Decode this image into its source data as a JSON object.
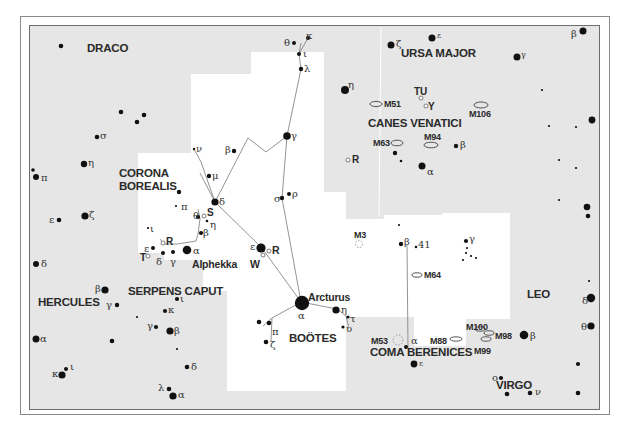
{
  "map": {
    "type": "star-chart",
    "region": "Boötes, Corona Borealis, Canes Venatici, Coma Berenices",
    "colors": {
      "background_outside": "#e6e6e6",
      "highlight_region": "#ffffff",
      "star": "#111111",
      "lines": "#777777",
      "variable_star": "#9a9a9a",
      "border": "#6e6e6e"
    }
  },
  "constellations": [
    {
      "id": "draco",
      "name": "DRACO"
    },
    {
      "id": "ursa-major",
      "name": "URSA MAJOR"
    },
    {
      "id": "canes-venatici",
      "name": "CANES VENATICI"
    },
    {
      "id": "corona-borealis",
      "name": "CORONA\nBOREALIS",
      "line1": "CORONA",
      "line2": "BOREALIS"
    },
    {
      "id": "hercules",
      "name": "HERCULES"
    },
    {
      "id": "serpens-caput",
      "name": "SERPENS CAPUT"
    },
    {
      "id": "bootes",
      "name": "BOÖTES"
    },
    {
      "id": "coma-berenices",
      "name": "COMA BERENICES"
    },
    {
      "id": "leo",
      "name": "LEO"
    },
    {
      "id": "virgo",
      "name": "VIRGO"
    }
  ],
  "named_stars": [
    {
      "name": "Arcturus",
      "designation": "α Boötis"
    },
    {
      "name": "Alphekka",
      "designation": "α Coronae Borealis"
    }
  ],
  "deep_sky_objects": [
    "M51",
    "M106",
    "M63",
    "M94",
    "M3",
    "M64",
    "M53",
    "M100",
    "M98",
    "M88",
    "M99"
  ],
  "variable_stars": [
    "TU",
    "Y",
    "R",
    "S",
    "R",
    "W",
    "R",
    "T"
  ],
  "greek_labels": {
    "ursa_major": [
      "ζ",
      "ε",
      "γ",
      "β",
      "η"
    ],
    "draco": [
      "σ",
      "η",
      "π",
      "ε",
      "ζ",
      "δ"
    ],
    "bootes": [
      "θ",
      "κ",
      "ι",
      "λ",
      "β",
      "γ",
      "δ",
      "μ",
      "ν",
      "σ",
      "ρ",
      "ε",
      "α",
      "η",
      "τ",
      "υ",
      "π",
      "ζ"
    ],
    "corona_borealis": [
      "π",
      "θ",
      "η",
      "β",
      "ι",
      "ε",
      "δ",
      "γ",
      "α"
    ],
    "canes_venatici": [
      "β",
      "α"
    ],
    "hercules_serpens": [
      "β",
      "γ",
      "α",
      "κ",
      "ι",
      "γ",
      "β",
      "ι",
      "κ",
      "δ",
      "λ",
      "α"
    ],
    "coma": [
      "β",
      "γ",
      "α"
    ],
    "leo": [
      "δ",
      "θ",
      "β"
    ],
    "virgo": [
      "ε",
      "ο",
      "ν"
    ]
  },
  "labels": {
    "draco": "DRACO",
    "ursa_major": "URSA MAJOR",
    "canes_venatici": "CANES VENATICI",
    "corona_1": "CORONA",
    "corona_2": "BOREALIS",
    "hercules": "HERCULES",
    "serpens": "SERPENS CAPUT",
    "bootes": "BOÖTES",
    "coma": "COMA BERENICES",
    "leo": "LEO",
    "virgo": "VIRGO",
    "arcturus": "Arcturus",
    "alphekka": "Alphekka",
    "m51": "M51",
    "m106": "M106",
    "m63": "M63",
    "m94": "M94",
    "m3": "M3",
    "m64": "M64",
    "m53": "M53",
    "m100": "M100",
    "m98": "M98",
    "m88": "M88",
    "m99": "M99",
    "tu": "TU",
    "y": "Y",
    "r_cvn": "R",
    "s_crb": "S",
    "r_crb": "R",
    "t_crb": "T",
    "w_boo": "W",
    "r_boo": "R",
    "n41": "41"
  }
}
